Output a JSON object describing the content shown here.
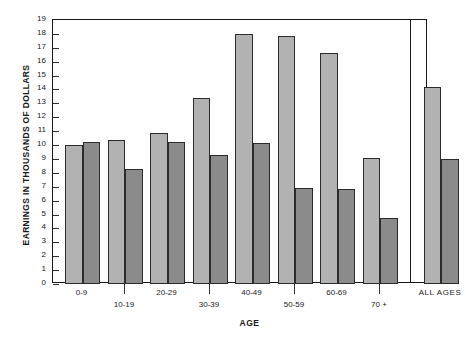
{
  "chart_data": {
    "type": "bar",
    "title": "",
    "xlabel": "AGE",
    "ylabel": "EARNINGS IN THOUSANDS OF DOLLARS",
    "categories": [
      "0-9",
      "10-19",
      "20-29",
      "30-39",
      "40-49",
      "50-59",
      "60-69",
      "70 +",
      "ALL AGES"
    ],
    "series": [
      {
        "name": "light",
        "color": "#b2b2b2",
        "values": [
          10.0,
          10.35,
          10.85,
          13.4,
          18.0,
          17.85,
          16.65,
          9.1,
          14.2
        ]
      },
      {
        "name": "dark",
        "color": "#8b8b8b",
        "values": [
          10.2,
          8.25,
          10.25,
          9.3,
          10.15,
          6.9,
          6.85,
          4.75,
          9.0
        ]
      }
    ],
    "ylim": [
      0,
      19
    ],
    "ytick_values": [
      0,
      1,
      2,
      3,
      4,
      5,
      6,
      7,
      8,
      9,
      10,
      11,
      12,
      13,
      14,
      15,
      16,
      17,
      18,
      19
    ],
    "ytick_labels": [
      "0",
      "1",
      "2",
      "3",
      "4",
      "5",
      "6",
      "7",
      "8",
      "9",
      "10",
      "11",
      "12",
      "13",
      "14",
      "15",
      "16",
      "17",
      "18",
      "19"
    ],
    "grid": false,
    "legend": "none",
    "separator_before_category": "ALL AGES",
    "label_stagger": [
      "top",
      "bottom",
      "top",
      "bottom",
      "top",
      "bottom",
      "top",
      "bottom",
      "top"
    ]
  },
  "colors": {
    "axis": "#1a1a1a",
    "bar_light": "#b2b2b2",
    "bar_dark": "#8b8b8b",
    "bar_edge": "#2b2b2b",
    "background": "#ffffff"
  }
}
